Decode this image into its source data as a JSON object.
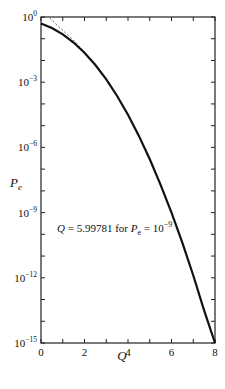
{
  "chart_data": {
    "type": "line",
    "title": "",
    "xlabel": "Q",
    "ylabel": "P_e",
    "xlim": [
      0,
      8
    ],
    "ylim_log10": [
      -15,
      0
    ],
    "yscale": "log",
    "grid": false,
    "x_ticks": [
      "0",
      "2",
      "4",
      "6",
      "8"
    ],
    "y_ticks": [
      {
        "base": "10",
        "exp": "0",
        "log": 0
      },
      {
        "base": "10",
        "exp": "−3",
        "log": -3
      },
      {
        "base": "10",
        "exp": "−6",
        "log": -6
      },
      {
        "base": "10",
        "exp": "−9",
        "log": -9
      },
      {
        "base": "10",
        "exp": "−12",
        "log": -12
      },
      {
        "base": "10",
        "exp": "−15",
        "log": -15
      }
    ],
    "series": [
      {
        "name": "P_e = Q(x)",
        "style": "solid",
        "x": [
          0,
          0.5,
          1,
          1.5,
          2,
          2.5,
          3,
          3.5,
          4,
          4.5,
          5,
          5.5,
          6,
          6.5,
          7,
          7.5,
          8
        ],
        "log10_y": [
          -0.301,
          -0.511,
          -0.799,
          -1.175,
          -1.643,
          -2.207,
          -2.87,
          -3.633,
          -4.499,
          -5.469,
          -6.543,
          -7.721,
          -9.006,
          -10.396,
          -11.893,
          -13.496,
          -15.206
        ]
      },
      {
        "name": "upper bound",
        "style": "dashed",
        "x": [
          0.4,
          0.6,
          0.8,
          1.0,
          1.2,
          1.5,
          1.8,
          2.0
        ],
        "log10_y": [
          -0.047,
          -0.24,
          -0.43,
          -0.616,
          -0.794,
          -1.068,
          -1.388,
          -1.632
        ]
      }
    ],
    "annotation": {
      "prefix": "Q = 5.99781 for ",
      "var": "P",
      "sub": "e",
      "eq": " = 10",
      "exp": "−9"
    }
  }
}
